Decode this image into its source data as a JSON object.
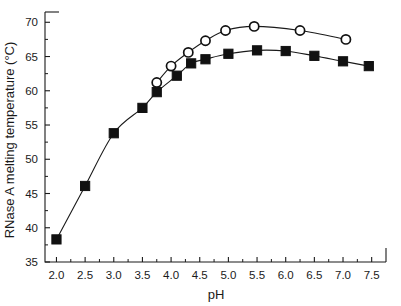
{
  "chart_data": {
    "type": "line",
    "title": "",
    "xlabel": "pH",
    "ylabel": "RNase A melting temperature (°C)",
    "xlim": [
      1.8,
      7.75
    ],
    "ylim": [
      35,
      71.5
    ],
    "xticks": [
      2.0,
      2.5,
      3.0,
      3.5,
      4.0,
      4.5,
      5.0,
      5.5,
      6.0,
      6.5,
      7.0,
      7.5
    ],
    "xtick_labels": [
      "2.0",
      "2.5",
      "3.0",
      "3.5",
      "4.0",
      "4.5",
      "5.0",
      "5.5",
      "6.0",
      "6.5",
      "7.0",
      "7.5"
    ],
    "yticks": [
      35,
      40,
      45,
      50,
      55,
      60,
      65,
      70
    ],
    "ytick_labels": [
      "35",
      "40",
      "45",
      "50",
      "55",
      "60",
      "65",
      "70"
    ],
    "grid": false,
    "legend": "none",
    "series": [
      {
        "name": "filled-squares",
        "marker": "square-filled",
        "color": "#111111",
        "points": [
          {
            "x": 2.0,
            "y": 38.3
          },
          {
            "x": 2.5,
            "y": 46.1
          },
          {
            "x": 3.0,
            "y": 53.8
          },
          {
            "x": 3.5,
            "y": 57.5
          },
          {
            "x": 3.75,
            "y": 59.8
          },
          {
            "x": 4.1,
            "y": 62.2
          },
          {
            "x": 4.35,
            "y": 64.0
          },
          {
            "x": 4.6,
            "y": 64.6
          },
          {
            "x": 5.0,
            "y": 65.4
          },
          {
            "x": 5.5,
            "y": 65.9
          },
          {
            "x": 6.0,
            "y": 65.8
          },
          {
            "x": 6.5,
            "y": 65.1
          },
          {
            "x": 7.0,
            "y": 64.3
          },
          {
            "x": 7.45,
            "y": 63.6
          }
        ]
      },
      {
        "name": "open-circles",
        "marker": "circle-open",
        "color": "#111111",
        "points": [
          {
            "x": 3.75,
            "y": 61.2
          },
          {
            "x": 4.0,
            "y": 63.6
          },
          {
            "x": 4.3,
            "y": 65.6
          },
          {
            "x": 4.6,
            "y": 67.3
          },
          {
            "x": 4.95,
            "y": 68.8
          },
          {
            "x": 5.45,
            "y": 69.4
          },
          {
            "x": 6.25,
            "y": 68.8
          },
          {
            "x": 7.05,
            "y": 67.5
          }
        ]
      }
    ]
  }
}
